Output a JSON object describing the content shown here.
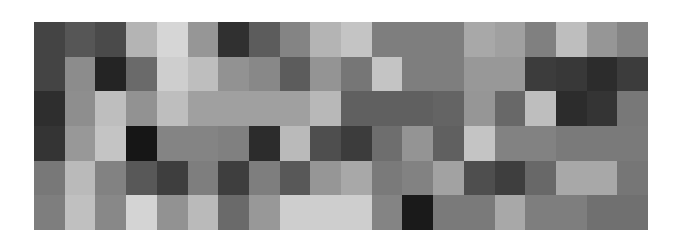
{
  "figure": {
    "background": "#ffffff",
    "plot_area": {
      "left": 34,
      "top": 22,
      "width": 614,
      "height": 208
    }
  },
  "chart_data": {
    "type": "heatmap",
    "title": "",
    "subtitle": "",
    "xlabel": "",
    "ylabel": "",
    "colormap": "gray",
    "grid": false,
    "legend": "none",
    "axis_visible": false,
    "tick_labels_x": [],
    "tick_labels_y": [],
    "rows": 6,
    "cols": 20,
    "value_range": [
      0,
      255
    ],
    "annotations": [],
    "values": [
      [
        68,
        86,
        74,
        180,
        214,
        150,
        48,
        92,
        132,
        180,
        196,
        126,
        126,
        126,
        168,
        160,
        128,
        190,
        150,
        132
      ],
      [
        68,
        140,
        36,
        106,
        206,
        190,
        146,
        136,
        92,
        148,
        118,
        196,
        126,
        126,
        152,
        152,
        60,
        56,
        44,
        60
      ],
      [
        46,
        142,
        190,
        146,
        190,
        160,
        160,
        160,
        160,
        184,
        96,
        96,
        96,
        100,
        150,
        104,
        190,
        44,
        52,
        120
      ],
      [
        52,
        152,
        196,
        22,
        132,
        132,
        128,
        44,
        186,
        78,
        60,
        110,
        148,
        96,
        196,
        130,
        130,
        122,
        122,
        122
      ],
      [
        120,
        186,
        130,
        88,
        62,
        126,
        62,
        126,
        88,
        150,
        168,
        122,
        130,
        162,
        78,
        62,
        104,
        168,
        168,
        118
      ],
      [
        126,
        192,
        136,
        212,
        146,
        186,
        106,
        152,
        206,
        206,
        206,
        132,
        26,
        122,
        122,
        168,
        126,
        126,
        112,
        112
      ]
    ]
  }
}
